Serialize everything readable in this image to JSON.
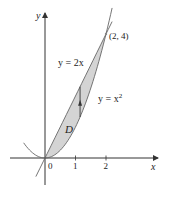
{
  "figure": {
    "axes": {
      "x_label": "x",
      "y_label": "y",
      "x_ticks": [
        {
          "value": 0,
          "label": "0"
        },
        {
          "value": 1,
          "label": "1"
        },
        {
          "value": 2,
          "label": "2"
        }
      ]
    },
    "curves": [
      {
        "name": "line",
        "equation_label": "y = 2x",
        "expr": "2x",
        "x_range": [
          -0.3,
          2.2
        ]
      },
      {
        "name": "parabola",
        "equation_label_base": "y = x",
        "equation_label_sup": "2",
        "expr": "x^2",
        "x_range": [
          -0.7,
          2.2
        ]
      }
    ],
    "intersection_point": {
      "x": 2,
      "y": 4,
      "label": "(2, 4)"
    },
    "region": {
      "label": "D",
      "between": [
        "x^2",
        "2x"
      ],
      "x_range": [
        0,
        2
      ],
      "fill": "#d4d4d4"
    },
    "vertical_arrow": {
      "x": 1.15,
      "from": "x^2",
      "to": "2x"
    },
    "colors": {
      "axis": "#333333",
      "curve": "#555555",
      "region_fill": "#d4d4d4",
      "text": "#222222"
    }
  }
}
